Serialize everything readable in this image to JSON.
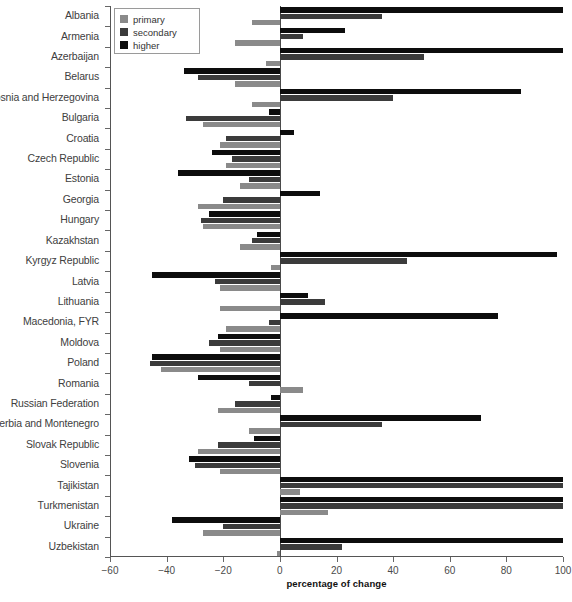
{
  "chart_data": {
    "type": "bar",
    "orientation": "horizontal",
    "title": "",
    "xlabel": "percentage of change",
    "ylabel": "",
    "xlim": [
      -60,
      100
    ],
    "xticks": [
      -60,
      -40,
      -20,
      0,
      20,
      40,
      60,
      80,
      100
    ],
    "xticklabels": [
      "−60",
      "−40",
      "−20",
      "0",
      "20",
      "40",
      "60",
      "80",
      "100"
    ],
    "grid": false,
    "legend_position": "upper-left-inside",
    "categories": [
      "Albania",
      "Armenia",
      "Azerbaijan",
      "Belarus",
      "Bosnia and Herzegovina",
      "Bulgaria",
      "Croatia",
      "Czech Republic",
      "Estonia",
      "Georgia",
      "Hungary",
      "Kazakhstan",
      "Kyrgyz Republic",
      "Latvia",
      "Lithuania",
      "Macedonia, FYR",
      "Moldova",
      "Poland",
      "Romania",
      "Russian Federation",
      "Serbia and Montenegro",
      "Slovak Republic",
      "Slovenia",
      "Tajikistan",
      "Turkmenistan",
      "Ukraine",
      "Uzbekistan"
    ],
    "series": [
      {
        "name": "primary",
        "color": "#8a8a8a",
        "values": [
          -10,
          -16,
          -5,
          -16,
          -10,
          -27,
          -21,
          -19,
          -14,
          -29,
          -27,
          -14,
          -3,
          -21,
          -21,
          -19,
          -21,
          -42,
          8,
          -22,
          -11,
          -29,
          -21,
          7,
          17,
          -27,
          -1
        ]
      },
      {
        "name": "secondary",
        "color": "#3b3b3b",
        "values": [
          36,
          8,
          51,
          -29,
          40,
          -33,
          -19,
          -17,
          -11,
          -20,
          -28,
          -10,
          45,
          -23,
          16,
          -4,
          -25,
          -46,
          -11,
          -16,
          36,
          -22,
          -30,
          100,
          100,
          -20,
          22
        ]
      },
      {
        "name": "higher",
        "color": "#0d0d0d",
        "values": [
          100,
          23,
          100,
          -34,
          85,
          -4,
          5,
          -24,
          -36,
          14,
          -25,
          -8,
          98,
          -45,
          10,
          77,
          -22,
          -45,
          -29,
          -3,
          71,
          -9,
          -32,
          100,
          100,
          -38,
          100
        ]
      }
    ]
  },
  "legend": {
    "items": [
      {
        "label": "primary",
        "color": "#8a8a8a"
      },
      {
        "label": "secondary",
        "color": "#3b3b3b"
      },
      {
        "label": "higher",
        "color": "#0d0d0d"
      }
    ]
  }
}
